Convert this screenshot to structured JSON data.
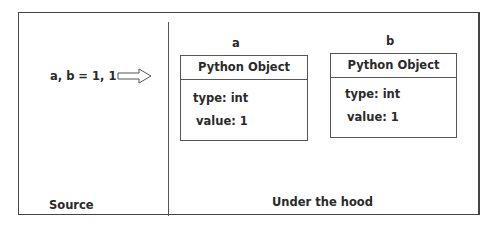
{
  "source": {
    "code": "a, b = 1, 1",
    "label": "Source",
    "arrow_icon": "right-arrow-outline"
  },
  "under_the_hood": {
    "label": "Under the hood",
    "objects": [
      {
        "name": "a",
        "title": "Python Object",
        "type": "type: int",
        "value": "value: 1"
      },
      {
        "name": "b",
        "title": "Python Object",
        "type": "type: int",
        "value": "value: 1"
      }
    ]
  },
  "colors": {
    "border": "#444444",
    "text": "#2a2a2a",
    "background": "#ffffff"
  }
}
